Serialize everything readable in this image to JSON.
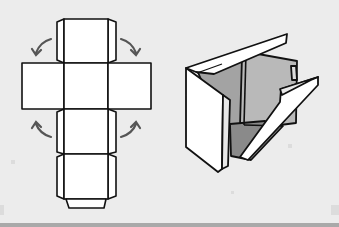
{
  "figure": {
    "caption": "",
    "panels": [
      {
        "id": "cube-net",
        "description": "Unfolded box net: cross-shaped layout of squares with glue flaps and curved folding arrows"
      },
      {
        "id": "folded-box",
        "description": "Partially assembled box with open lid and one side flap folding inward, gray interior"
      }
    ],
    "arrows": [
      {
        "position": "top-left",
        "direction": "fold-down"
      },
      {
        "position": "top-right",
        "direction": "fold-down"
      },
      {
        "position": "bottom-left",
        "direction": "fold-up"
      },
      {
        "position": "bottom-right",
        "direction": "fold-up"
      }
    ]
  },
  "colors": {
    "background": "#ececec",
    "outline": "#111111",
    "panel_fill": "#ffffff",
    "interior_light": "#b9b9b9",
    "interior_dark": "#8a8a8a",
    "arrow": "#555555",
    "bottom_bar": "#a9a9a9"
  }
}
